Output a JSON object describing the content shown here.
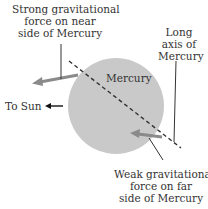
{
  "diagram": {
    "planet_label": "Mercury",
    "near_force_label": [
      "Strong gravitational",
      "force on near",
      "side of Mercury"
    ],
    "long_axis_label": [
      "Long",
      "axis of",
      "Mercury"
    ],
    "sun_label": "To Sun",
    "far_force_label": [
      "Weak gravitational",
      "force on far",
      "side of Mercury"
    ],
    "colors": {
      "planet": "#c9c9c9",
      "force_arrow": "#8a8a8a",
      "line": "#333333"
    }
  }
}
